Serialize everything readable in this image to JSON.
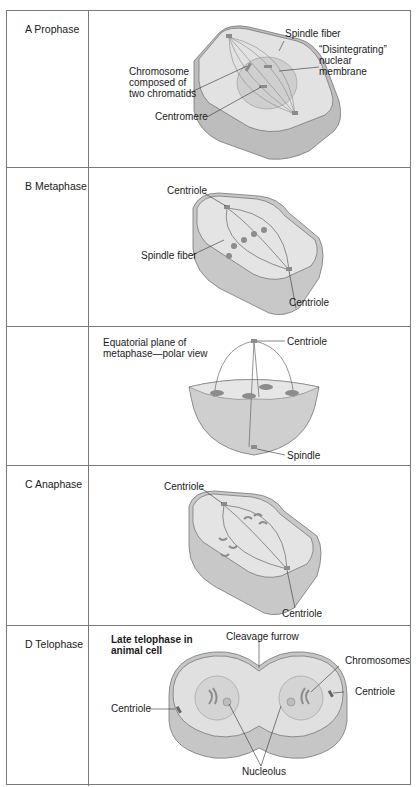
{
  "figure": {
    "rows": [
      {
        "phase": "A Prophase",
        "labels": {
          "spindle_fiber": "Spindle fiber",
          "disintegrating_1": "“Disintegrating”",
          "disintegrating_2": "nuclear",
          "disintegrating_3": "membrane",
          "chromosome_1": "Chromosome",
          "chromosome_2": "composed of",
          "chromosome_3": "two chromatids",
          "centromere": "Centromere"
        }
      },
      {
        "phase": "B Metaphase",
        "labels": {
          "centriole_top": "Centriole",
          "spindle_fiber": "Spindle fiber",
          "centriole_bottom": "Centriole"
        }
      },
      {
        "phase": "",
        "labels": {
          "equatorial_1": "Equatorial plane of",
          "equatorial_2": "metaphase—polar view",
          "centriole": "Centriole",
          "spindle": "Spindle"
        }
      },
      {
        "phase": "C Anaphase",
        "labels": {
          "centriole_top": "Centriole",
          "centriole_bottom": "Centriole"
        }
      },
      {
        "phase": "D Telophase",
        "labels": {
          "title_1": "Late telophase in",
          "title_2": "animal cell",
          "cleavage_furrow": "Cleavage furrow",
          "chromosomes": "Chromosomes",
          "centriole_right": "Centriole",
          "centriole_left": "Centriole",
          "nucleolus": "Nucleolus"
        }
      }
    ]
  },
  "colors": {
    "border": "#7a7a7a",
    "cell_fill": "#d9d9d9",
    "cell_side": "#bdbdbd",
    "chromosome": "#8c8c8c"
  }
}
